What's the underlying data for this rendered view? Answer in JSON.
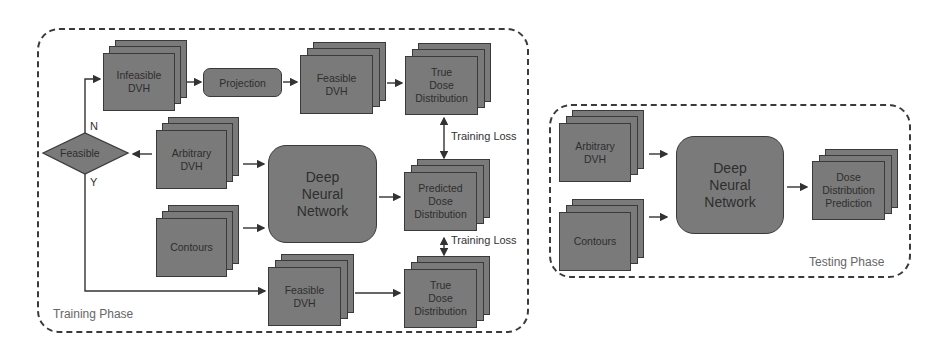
{
  "training_phase": {
    "label": "Training Phase",
    "infeasible_dvh": "Infeasible\nDVH",
    "projection": "Projection",
    "feasible_dvh_top": "Feasible\nDVH",
    "true_dose_top": "True\nDose\nDistribution",
    "feasible_decision": "Feasible",
    "branch_no": "N",
    "branch_yes": "Y",
    "arbitrary_dvh": "Arbitrary\nDVH",
    "contours": "Contours",
    "dnn": "Deep\nNeural\nNetwork",
    "predicted_dose": "Predicted\nDose\nDistribution",
    "feasible_dvh_bottom": "Feasible\nDVH",
    "true_dose_bottom": "True\nDose\nDistribution",
    "loss_top": "Training Loss",
    "loss_bottom": "Training Loss"
  },
  "testing_phase": {
    "label": "Testing Phase",
    "arbitrary_dvh": "Arbitrary\nDVH",
    "contours": "Contours",
    "dnn": "Deep\nNeural\nNetwork",
    "output": "Dose\nDistribution\nPrediction"
  },
  "colors": {
    "box_fill": "#7a7a7a",
    "border": "#3a3a3a",
    "text": "#2e2e2e"
  }
}
